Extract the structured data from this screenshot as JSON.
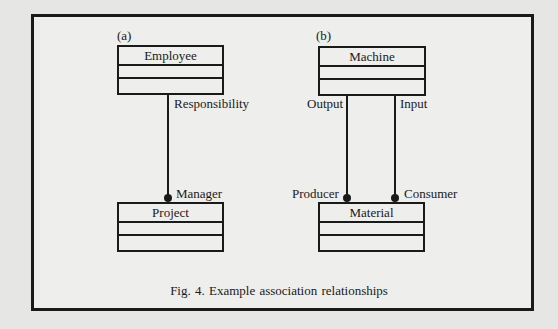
{
  "figure": {
    "caption": "Fig. 4. Example association relationships"
  },
  "panels": {
    "a": {
      "label": "(a)",
      "classes": {
        "top": {
          "name": "Employee"
        },
        "bottom": {
          "name": "Project"
        }
      },
      "association": {
        "roles": {
          "source": "Responsibility",
          "target": "Manager"
        },
        "target_end": "filled-dot"
      }
    },
    "b": {
      "label": "(b)",
      "classes": {
        "top": {
          "name": "Machine"
        },
        "bottom": {
          "name": "Material"
        }
      },
      "associations": [
        {
          "source_role": "Output",
          "target_role": "Producer",
          "target_end": "filled-dot"
        },
        {
          "source_role": "Input",
          "target_role": "Consumer",
          "target_end": "filled-dot"
        }
      ]
    }
  },
  "colors": {
    "background": "#e6e6e4",
    "frame_fill": "#eeeeec",
    "ink": "#1a1a1a"
  }
}
